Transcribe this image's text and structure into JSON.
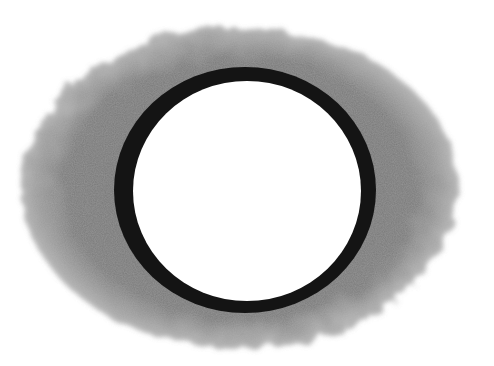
{
  "image": {
    "description": "Pencil drawing of a dark ring (hole) surrounded by soft gray shading on white paper",
    "colors": {
      "paper": "#ffffff",
      "shading": "#7d7d7d",
      "shading_edge": "#a8a8a8",
      "ring": "#141414",
      "hole": "#ffffff"
    }
  }
}
